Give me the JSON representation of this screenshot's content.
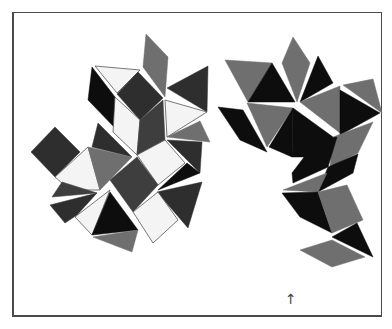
{
  "figure": {
    "arrow_symbol": "↑",
    "colors": {
      "black": "#0d0d0d",
      "dark": "#2e2e2e",
      "darkgray": "#3e3e3e",
      "gray": "#6f6f6f",
      "white": "#f4f4f4",
      "outline": "#555555",
      "frame": "#4a4a4a"
    },
    "left_cluster": [
      {
        "shape": "rhombus",
        "fill": "gray",
        "points": "146,34 168,57 165,97 143,67"
      },
      {
        "shape": "rhombus",
        "fill": "black",
        "points": "92,67 115,97 115,128 88,100"
      },
      {
        "shape": "triangle",
        "fill": "white",
        "points": "95,66 140,70 117,93"
      },
      {
        "shape": "square",
        "fill": "dark",
        "points": "117,94 138,72 163,98 140,120"
      },
      {
        "shape": "triangle",
        "fill": "dark",
        "points": "167,88 208,66 207,112"
      },
      {
        "shape": "rhombus",
        "fill": "white",
        "points": "115,97 140,120 137,155 113,132"
      },
      {
        "shape": "rhombus",
        "fill": "darkgray",
        "points": "140,120 163,100 165,140 137,155"
      },
      {
        "shape": "triangle",
        "fill": "white",
        "points": "165,100 207,112 167,137"
      },
      {
        "shape": "triangle",
        "fill": "gray",
        "points": "167,137 200,121 210,142"
      },
      {
        "shape": "square",
        "fill": "dark",
        "points": "31,152 55,127 80,152 55,177"
      },
      {
        "shape": "triangle",
        "fill": "dark",
        "points": "92,147 98,123 132,157"
      },
      {
        "shape": "rhombus",
        "fill": "white",
        "points": "55,177 88,147 100,190 70,190"
      },
      {
        "shape": "triangle",
        "fill": "gray",
        "points": "88,147 132,157 100,190"
      },
      {
        "shape": "rhombus",
        "fill": "white",
        "points": "137,155 165,140 185,163 158,185"
      },
      {
        "shape": "square",
        "fill": "darkgray",
        "points": "110,180 137,157 158,185 133,212"
      },
      {
        "shape": "triangle",
        "fill": "dark",
        "points": "167,140 202,142 200,173"
      },
      {
        "shape": "triangle",
        "fill": "black",
        "points": "158,190 187,163 200,173"
      },
      {
        "shape": "triangle",
        "fill": "dark",
        "points": "157,192 202,182 188,228"
      },
      {
        "shape": "triangle",
        "fill": "darkgray",
        "points": "52,197 62,182 97,193"
      },
      {
        "shape": "rhombus",
        "fill": "dark",
        "points": "50,205 97,193 77,215 65,223"
      },
      {
        "shape": "rhombus",
        "fill": "white",
        "points": "75,217 110,190 92,235"
      },
      {
        "shape": "triangle",
        "fill": "black",
        "points": "92,235 110,192 138,230"
      },
      {
        "shape": "triangle",
        "fill": "gray",
        "points": "93,237 138,230 132,252"
      },
      {
        "shape": "rhombus",
        "fill": "white",
        "points": "133,212 158,192 178,220 153,243"
      }
    ],
    "right_cluster": [
      {
        "shape": "triangle",
        "fill": "gray",
        "points": "225,60 272,63 248,102"
      },
      {
        "shape": "triangle",
        "fill": "black",
        "points": "272,63 295,102 248,102"
      },
      {
        "shape": "rhombus",
        "fill": "gray",
        "points": "293,37 310,63 297,102 282,63"
      },
      {
        "shape": "triangle",
        "fill": "black",
        "points": "318,56 333,83 300,102"
      },
      {
        "shape": "triangle",
        "fill": "gray",
        "points": "343,85 373,79 382,113"
      },
      {
        "shape": "triangle",
        "fill": "gray",
        "points": "300,102 340,86 340,133"
      },
      {
        "shape": "triangle",
        "fill": "black",
        "points": "340,90 380,113 340,135"
      },
      {
        "shape": "rhombus",
        "fill": "black",
        "points": "218,107 243,110 267,152 240,140"
      },
      {
        "shape": "triangle",
        "fill": "gray",
        "points": "247,103 293,108 267,147"
      },
      {
        "shape": "triangle",
        "fill": "black",
        "points": "293,108 292,157 269,147"
      },
      {
        "shape": "rhombus",
        "fill": "black",
        "points": "293,108 333,137 317,157 292,157"
      },
      {
        "shape": "rhombus",
        "fill": "gray",
        "points": "333,137 373,122 358,153 330,167"
      },
      {
        "shape": "rhombus",
        "fill": "black",
        "points": "317,140 337,137 328,167 293,183 292,173"
      },
      {
        "shape": "rhombus",
        "fill": "black",
        "points": "328,167 358,154 353,173 318,192"
      },
      {
        "shape": "triangle",
        "fill": "gray",
        "points": "283,190 327,173 318,192"
      },
      {
        "shape": "rhombus",
        "fill": "black",
        "points": "282,193 318,192 332,233 300,217"
      },
      {
        "shape": "square",
        "fill": "gray",
        "points": "318,192 347,185 363,220 332,233"
      },
      {
        "shape": "triangle",
        "fill": "black",
        "points": "332,237 357,223 373,257"
      },
      {
        "shape": "rhombus",
        "fill": "gray",
        "points": "300,250 332,240 365,257 332,267"
      }
    ]
  }
}
